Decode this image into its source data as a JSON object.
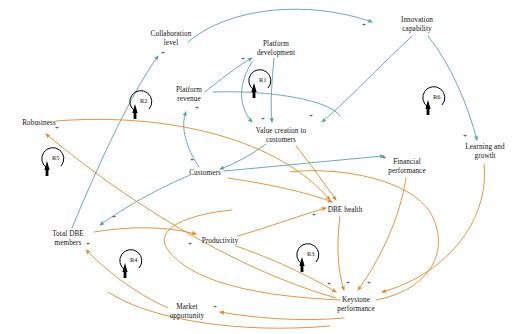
{
  "diagram": {
    "type": "causal-loop-diagram",
    "canvas": {
      "width": 514,
      "height": 334,
      "background": "#ffffff"
    },
    "colors": {
      "teal": "#4e9e9c",
      "orange": "#e2811f",
      "text": "#111111",
      "loop": "#000000"
    }
  },
  "nodes": [
    {
      "id": "collaboration_level",
      "label": "Collaboration\nlevel",
      "x": 170,
      "y": 38
    },
    {
      "id": "platform_revenue",
      "label": "Platform\nrevenue",
      "x": 189,
      "y": 95
    },
    {
      "id": "platform_development",
      "label": "Platform\ndevelopment",
      "x": 276,
      "y": 49
    },
    {
      "id": "innovation_capability",
      "label": "Innovation\ncapability",
      "x": 417,
      "y": 25
    },
    {
      "id": "value_creation",
      "label": "Value creation to\ncustomers",
      "x": 281,
      "y": 136
    },
    {
      "id": "learning_growth",
      "label": "Learning and\ngrowth",
      "x": 485,
      "y": 152
    },
    {
      "id": "financial_performance",
      "label": "Financial\nperformance",
      "x": 407,
      "y": 167
    },
    {
      "id": "robustness",
      "label": "Robustness",
      "x": 38,
      "y": 123
    },
    {
      "id": "customers",
      "label": "Customers",
      "x": 205,
      "y": 173
    },
    {
      "id": "dbe_health",
      "label": "DBE health",
      "x": 345,
      "y": 210
    },
    {
      "id": "total_dbe_members",
      "label": "Total DBE\nmembers",
      "x": 68,
      "y": 239
    },
    {
      "id": "productivity",
      "label": "Productivity",
      "x": 219,
      "y": 241
    },
    {
      "id": "keystone_performance",
      "label": "Keystone\nperformance",
      "x": 355,
      "y": 305
    },
    {
      "id": "market_opportunity",
      "label": "Market\nopportunity",
      "x": 186,
      "y": 313
    }
  ],
  "loops": [
    {
      "id": "R1",
      "label": "R1",
      "x": 262,
      "y": 79,
      "direction": "reinforcing"
    },
    {
      "id": "R2",
      "label": "R2",
      "x": 143,
      "y": 100,
      "direction": "reinforcing"
    },
    {
      "id": "R3",
      "label": "R3",
      "x": 310,
      "y": 253,
      "direction": "reinforcing"
    },
    {
      "id": "R4",
      "label": "R4",
      "x": 133,
      "y": 259,
      "direction": "reinforcing"
    },
    {
      "id": "R5",
      "label": "R5",
      "x": 55,
      "y": 157,
      "direction": "reinforcing"
    },
    {
      "id": "R6",
      "label": "R6",
      "x": 436,
      "y": 96,
      "direction": "reinforcing"
    }
  ],
  "link_signs": [
    {
      "sign": "+",
      "x": 163,
      "y": 54
    },
    {
      "sign": "+",
      "x": 197,
      "y": 109
    },
    {
      "sign": "+",
      "x": 243,
      "y": 60
    },
    {
      "sign": "+",
      "x": 263,
      "y": 120
    },
    {
      "sign": "+",
      "x": 311,
      "y": 117
    },
    {
      "sign": "+",
      "x": 364,
      "y": 26
    },
    {
      "sign": "+",
      "x": 465,
      "y": 137
    },
    {
      "sign": "+",
      "x": 384,
      "y": 159
    },
    {
      "sign": "+",
      "x": 192,
      "y": 161
    },
    {
      "sign": "+",
      "x": 57,
      "y": 129
    },
    {
      "sign": "+",
      "x": 114,
      "y": 218
    },
    {
      "sign": "+",
      "x": 88,
      "y": 245
    },
    {
      "sign": "+",
      "x": 190,
      "y": 245
    },
    {
      "sign": "+",
      "x": 314,
      "y": 216
    },
    {
      "sign": "+",
      "x": 329,
      "y": 285
    },
    {
      "sign": "+",
      "x": 348,
      "y": 284
    },
    {
      "sign": "+",
      "x": 369,
      "y": 284
    },
    {
      "sign": "+",
      "x": 215,
      "y": 308
    }
  ],
  "edges": [
    {
      "from": "total_dbe_members",
      "to": "collaboration_level",
      "polarity": "+",
      "color": "teal"
    },
    {
      "from": "customers",
      "to": "platform_revenue",
      "polarity": "+",
      "color": "teal"
    },
    {
      "from": "platform_revenue",
      "to": "platform_development",
      "polarity": "+",
      "color": "teal"
    },
    {
      "from": "platform_development",
      "to": "value_creation",
      "polarity": "+",
      "color": "teal"
    },
    {
      "from": "collaboration_level",
      "to": "innovation_capability",
      "polarity": "+",
      "color": "teal"
    },
    {
      "from": "value_creation",
      "to": "customers",
      "polarity": "+",
      "color": "teal"
    },
    {
      "from": "innovation_capability",
      "to": "value_creation",
      "polarity": "+",
      "color": "teal"
    },
    {
      "from": "innovation_capability",
      "to": "learning_growth",
      "polarity": "+",
      "color": "teal"
    },
    {
      "from": "customers",
      "to": "financial_performance",
      "polarity": "+",
      "color": "teal"
    },
    {
      "from": "platform_revenue",
      "to": "value_creation",
      "polarity": "+",
      "color": "teal"
    },
    {
      "from": "customers",
      "to": "total_dbe_members",
      "polarity": "+",
      "color": "teal"
    },
    {
      "from": "keystone_performance",
      "to": "robustness",
      "polarity": "+",
      "color": "orange"
    },
    {
      "from": "keystone_performance",
      "to": "dbe_health",
      "polarity": "+",
      "color": "orange"
    },
    {
      "from": "total_dbe_members",
      "to": "productivity",
      "polarity": "+",
      "color": "orange"
    },
    {
      "from": "productivity",
      "to": "keystone_performance",
      "polarity": "+",
      "color": "orange"
    },
    {
      "from": "market_opportunity",
      "to": "total_dbe_members",
      "polarity": "+",
      "color": "orange"
    },
    {
      "from": "keystone_performance",
      "to": "market_opportunity",
      "polarity": "+",
      "color": "orange"
    },
    {
      "from": "financial_performance",
      "to": "keystone_performance",
      "polarity": "+",
      "color": "orange"
    },
    {
      "from": "robustness",
      "to": "dbe_health",
      "polarity": "+",
      "color": "orange"
    },
    {
      "from": "dbe_health",
      "to": "keystone_performance",
      "polarity": "+",
      "color": "orange"
    },
    {
      "from": "learning_growth",
      "to": "keystone_performance",
      "polarity": "+",
      "color": "orange"
    }
  ]
}
